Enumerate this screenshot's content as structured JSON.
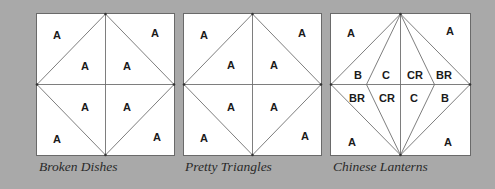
{
  "colors": {
    "background": "#a9a9a9",
    "block_fill": "#ffffff",
    "line": "#6e6e6e",
    "label": "#1a1a1a"
  },
  "blocks": [
    {
      "name": "Broken Dishes",
      "caption": "Broken Dishes",
      "labels": [
        "A",
        "A",
        "A",
        "A",
        "A",
        "A",
        "A",
        "A"
      ]
    },
    {
      "name": "Pretty Triangles",
      "caption": "Pretty Triangles",
      "labels": [
        "A",
        "A",
        "A",
        "A",
        "A",
        "A",
        "A",
        "A"
      ]
    },
    {
      "name": "Chinese Lanterns",
      "caption": "Chinese Lanterns",
      "labels": [
        "A",
        "A",
        "B",
        "C",
        "CR",
        "BR",
        "BR",
        "CR",
        "C",
        "B",
        "A",
        "A"
      ]
    }
  ]
}
